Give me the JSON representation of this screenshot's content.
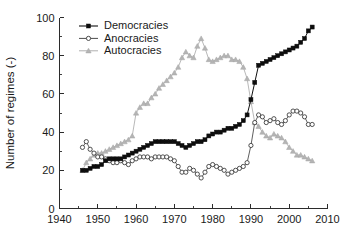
{
  "chart_data": {
    "type": "line",
    "title": "",
    "xlabel": "",
    "ylabel": "Number of regimes (-)",
    "xlim": [
      1940,
      2010
    ],
    "ylim": [
      0,
      100
    ],
    "xticks": [
      1940,
      1950,
      1960,
      1970,
      1980,
      1990,
      2000,
      2010
    ],
    "yticks": [
      0,
      20,
      40,
      60,
      80,
      100
    ],
    "xminor_step": 5,
    "yminor_step": 10,
    "grid": false,
    "legend_position": "upper left inside",
    "x": [
      1946,
      1947,
      1948,
      1949,
      1950,
      1951,
      1952,
      1953,
      1954,
      1955,
      1956,
      1957,
      1958,
      1959,
      1960,
      1961,
      1962,
      1963,
      1964,
      1965,
      1966,
      1967,
      1968,
      1969,
      1970,
      1971,
      1972,
      1973,
      1974,
      1975,
      1976,
      1977,
      1978,
      1979,
      1980,
      1981,
      1982,
      1983,
      1984,
      1985,
      1986,
      1987,
      1988,
      1989,
      1990,
      1991,
      1992,
      1993,
      1994,
      1995,
      1996,
      1997,
      1998,
      1999,
      2000,
      2001,
      2002,
      2003,
      2004,
      2005,
      2006
    ],
    "series": [
      {
        "name": "Democracies",
        "marker": "filled-square",
        "color": "#0d0d0d",
        "values": [
          20,
          20,
          21,
          22,
          22,
          23,
          25,
          26,
          26,
          26,
          26,
          27,
          28,
          29,
          30,
          31,
          32,
          33,
          34,
          35,
          35,
          35,
          35,
          35,
          35,
          34,
          33,
          32,
          33,
          34,
          35,
          35,
          36,
          38,
          39,
          40,
          40,
          41,
          42,
          42,
          43,
          44,
          46,
          49,
          57,
          66,
          75,
          76,
          77,
          78,
          79,
          80,
          81,
          82,
          83,
          84,
          85,
          87,
          89,
          93,
          95
        ]
      },
      {
        "name": "Anocracies",
        "marker": "open-circle",
        "color": "#3d3d3d",
        "values": [
          32,
          35,
          31,
          29,
          27,
          27,
          26,
          25,
          24,
          24,
          25,
          24,
          23,
          25,
          26,
          27,
          27,
          27,
          26,
          27,
          27,
          27,
          27,
          26,
          25,
          22,
          19,
          19,
          21,
          20,
          18,
          16,
          19,
          22,
          23,
          22,
          21,
          20,
          18,
          19,
          20,
          21,
          22,
          24,
          33,
          45,
          49,
          48,
          45,
          46,
          47,
          45,
          44,
          46,
          49,
          51,
          51,
          50,
          48,
          44,
          44
        ]
      },
      {
        "name": "Autocracies",
        "marker": "filled-triangle",
        "color": "#b4b4b4",
        "values": [
          20,
          24,
          26,
          28,
          29,
          29,
          30,
          31,
          32,
          33,
          34,
          35,
          36,
          38,
          50,
          53,
          55,
          55,
          58,
          60,
          63,
          65,
          67,
          69,
          71,
          74,
          79,
          82,
          80,
          79,
          85,
          89,
          84,
          78,
          77,
          78,
          79,
          80,
          80,
          78,
          78,
          77,
          74,
          68,
          56,
          45,
          43,
          40,
          38,
          37,
          39,
          38,
          37,
          35,
          32,
          30,
          28,
          28,
          27,
          26,
          25
        ]
      }
    ]
  },
  "legend": {
    "items": [
      {
        "label": "Democracies",
        "marker": "filled-square"
      },
      {
        "label": "Anocracies",
        "marker": "open-circle"
      },
      {
        "label": "Autocracies",
        "marker": "filled-triangle"
      }
    ]
  }
}
